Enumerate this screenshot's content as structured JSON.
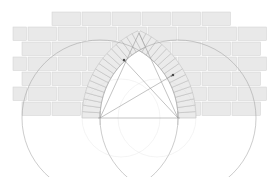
{
  "diagram": {
    "title": "Pointed arch geometric construction in brick wall",
    "type": "geometric-construction",
    "canvas": {
      "width": 278,
      "height": 177,
      "background": "#ffffff"
    },
    "colors": {
      "brick_fill": "#e9e9e9",
      "brick_stroke": "#cfcfcf",
      "mortar": "#ffffff",
      "voussoir_fill": "#ebebeb",
      "voussoir_stroke": "#b9b9b9",
      "construction_line": "#9a9a9a",
      "faint_circle": "#d8d8d8",
      "arrow": "#8c8c8c",
      "opening_fill": "#ffffff"
    },
    "wall": {
      "label": "brick wall",
      "left": 22,
      "right": 262,
      "top": 12,
      "bottom": 118,
      "course_height": 15,
      "courses": 7,
      "brick_length": 30,
      "joint": 1.6,
      "top_course_inset": 30
    },
    "springing_line": {
      "label": "springing line",
      "y": 118,
      "x_start": 100,
      "x_end": 178
    },
    "centers": [
      {
        "name": "left-center",
        "x": 100,
        "y": 118
      },
      {
        "name": "right-center",
        "x": 178,
        "y": 118
      }
    ],
    "arch": {
      "label": "pointed arch",
      "intrados_radius": 78,
      "extrados_radius": 96,
      "apex": {
        "x": 139,
        "y": 33
      },
      "voussoir_count": 17,
      "ring_thickness": 18
    },
    "construction_circles": [
      {
        "name": "large-circle-left",
        "cx": 100,
        "cy": 118,
        "r": 78
      },
      {
        "name": "large-circle-right",
        "cx": 178,
        "cy": 118,
        "r": 78
      },
      {
        "name": "small-circle-left",
        "cx": 121,
        "cy": 118,
        "r": 39
      },
      {
        "name": "small-circle-right",
        "cx": 157,
        "cy": 118,
        "r": 39
      }
    ],
    "radius_lines": [
      {
        "name": "radius-left-to-right-point",
        "x1": 100,
        "y1": 118,
        "x2": 173,
        "y2": 75
      },
      {
        "name": "radius-right-to-left-point",
        "x1": 178,
        "y1": 118,
        "x2": 124,
        "y2": 60
      },
      {
        "name": "radius-left-to-apex",
        "x1": 100,
        "y1": 118,
        "x2": 139,
        "y2": 33
      },
      {
        "name": "radius-right-to-apex",
        "x1": 178,
        "y1": 118,
        "x2": 139,
        "y2": 33
      }
    ],
    "markers": [
      {
        "name": "point-upper-left",
        "x": 124,
        "y": 60
      },
      {
        "name": "point-upper-right",
        "x": 173,
        "y": 75
      }
    ]
  }
}
